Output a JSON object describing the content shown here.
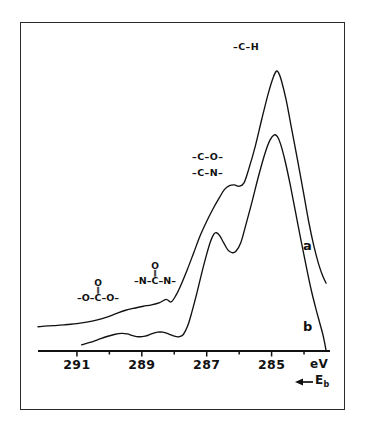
{
  "figure": {
    "domain_type": "xps-spectrum",
    "frame_color": "#2b2b2b",
    "curve_color": "#111111",
    "background": "#ffffff"
  },
  "axis": {
    "unit_label": "eV",
    "direction_label": "E",
    "direction_subscript": "b",
    "direction_arrow": "←",
    "tick_labels": [
      "291",
      "289",
      "287",
      "285"
    ],
    "tick_values": [
      291,
      289,
      287,
      285
    ],
    "minor_tick_values": [
      290,
      288,
      286,
      284
    ],
    "x_min": 292.2,
    "x_max": 283.2,
    "reversed": true
  },
  "annotations": {
    "ch_label": "–C–H",
    "co_label": "–C–O–",
    "cn_label": "–C–N–",
    "carbonate": {
      "top_atom": "O",
      "double_bond": "‖",
      "chain": "–O–C–O–"
    },
    "urea": {
      "top_atom": "O",
      "double_bond": "‖",
      "chain": "–N–C–N–"
    },
    "curve_a_tag": "a",
    "curve_b_tag": "b"
  },
  "chart_data": {
    "type": "line",
    "title": "",
    "subtitle": "",
    "xlabel": "eV",
    "ylabel": "",
    "xlim": [
      292.2,
      283.2
    ],
    "x_axis_reversed": true,
    "grid": false,
    "legend_position": "inline-right",
    "series": [
      {
        "name": "a",
        "label": "a",
        "points": [
          [
            292.2,
            0.085
          ],
          [
            291.9,
            0.088
          ],
          [
            291.6,
            0.09
          ],
          [
            291.3,
            0.093
          ],
          [
            291.0,
            0.096
          ],
          [
            290.7,
            0.101
          ],
          [
            290.4,
            0.108
          ],
          [
            290.1,
            0.118
          ],
          [
            289.8,
            0.131
          ],
          [
            289.5,
            0.143
          ],
          [
            289.2,
            0.151
          ],
          [
            288.95,
            0.157
          ],
          [
            288.7,
            0.162
          ],
          [
            288.45,
            0.17
          ],
          [
            288.25,
            0.181
          ],
          [
            288.1,
            0.172
          ],
          [
            287.95,
            0.195
          ],
          [
            287.8,
            0.23
          ],
          [
            287.6,
            0.285
          ],
          [
            287.4,
            0.345
          ],
          [
            287.2,
            0.405
          ],
          [
            287.0,
            0.455
          ],
          [
            286.8,
            0.5
          ],
          [
            286.6,
            0.54
          ],
          [
            286.45,
            0.567
          ],
          [
            286.3,
            0.58
          ],
          [
            286.15,
            0.583
          ],
          [
            286.0,
            0.578
          ],
          [
            285.85,
            0.59
          ],
          [
            285.7,
            0.64
          ],
          [
            285.5,
            0.72
          ],
          [
            285.3,
            0.815
          ],
          [
            285.1,
            0.905
          ],
          [
            284.95,
            0.96
          ],
          [
            284.85,
            0.982
          ],
          [
            284.78,
            0.975
          ],
          [
            284.7,
            0.95
          ],
          [
            284.55,
            0.88
          ],
          [
            284.4,
            0.79
          ],
          [
            284.2,
            0.67
          ],
          [
            284.0,
            0.545
          ],
          [
            283.85,
            0.45
          ],
          [
            283.7,
            0.37
          ],
          [
            283.55,
            0.305
          ],
          [
            283.42,
            0.262
          ],
          [
            283.32,
            0.238
          ]
        ]
      },
      {
        "name": "b",
        "label": "b",
        "points": [
          [
            290.85,
            0.022
          ],
          [
            290.6,
            0.03
          ],
          [
            290.35,
            0.04
          ],
          [
            290.1,
            0.05
          ],
          [
            289.85,
            0.058
          ],
          [
            289.62,
            0.062
          ],
          [
            289.45,
            0.06
          ],
          [
            289.28,
            0.054
          ],
          [
            289.1,
            0.05
          ],
          [
            288.9,
            0.052
          ],
          [
            288.7,
            0.06
          ],
          [
            288.52,
            0.066
          ],
          [
            288.35,
            0.066
          ],
          [
            288.18,
            0.06
          ],
          [
            288.0,
            0.052
          ],
          [
            287.85,
            0.05
          ],
          [
            287.72,
            0.058
          ],
          [
            287.58,
            0.09
          ],
          [
            287.45,
            0.14
          ],
          [
            287.3,
            0.205
          ],
          [
            287.15,
            0.275
          ],
          [
            287.0,
            0.34
          ],
          [
            286.88,
            0.385
          ],
          [
            286.78,
            0.41
          ],
          [
            286.7,
            0.415
          ],
          [
            286.6,
            0.405
          ],
          [
            286.48,
            0.38
          ],
          [
            286.35,
            0.355
          ],
          [
            286.22,
            0.345
          ],
          [
            286.1,
            0.35
          ],
          [
            285.95,
            0.38
          ],
          [
            285.8,
            0.44
          ],
          [
            285.6,
            0.525
          ],
          [
            285.4,
            0.615
          ],
          [
            285.2,
            0.695
          ],
          [
            285.05,
            0.74
          ],
          [
            284.92,
            0.758
          ],
          [
            284.82,
            0.752
          ],
          [
            284.72,
            0.725
          ],
          [
            284.58,
            0.665
          ],
          [
            284.42,
            0.58
          ],
          [
            284.25,
            0.48
          ],
          [
            284.08,
            0.38
          ],
          [
            283.92,
            0.29
          ],
          [
            283.78,
            0.215
          ],
          [
            283.65,
            0.155
          ],
          [
            283.52,
            0.1
          ],
          [
            283.42,
            0.058
          ],
          [
            283.35,
            0.02
          ],
          [
            283.32,
            0.0
          ]
        ]
      }
    ],
    "annotated_peaks": [
      {
        "label": "–C–H",
        "binding_energy": 285.0,
        "assignment": "C–H / C–C hydrocarbon"
      },
      {
        "label": "–C–O–",
        "binding_energy": 286.4,
        "assignment": "C–O ether/alcohol"
      },
      {
        "label": "–C–N–",
        "binding_energy": 286.4,
        "assignment": "C–N amine"
      },
      {
        "label": "–N–C(=O)–N–",
        "binding_energy": 288.7,
        "assignment": "urea carbonyl"
      },
      {
        "label": "–O–C(=O)–O–",
        "binding_energy": 290.2,
        "assignment": "carbonate"
      }
    ]
  }
}
